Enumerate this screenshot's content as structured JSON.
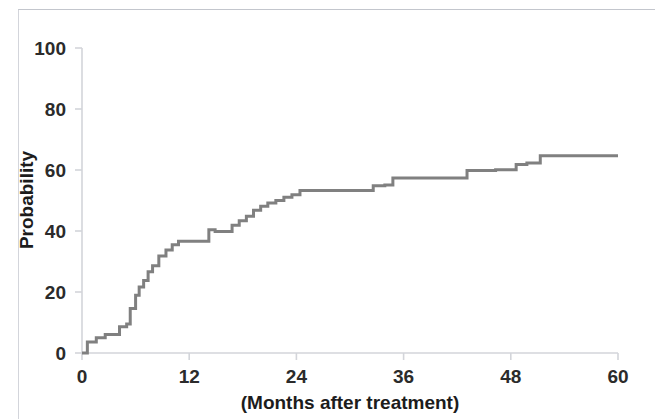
{
  "figure": {
    "background_color": "#ffffff",
    "axis_color": "#d3d5da",
    "tick_label_color": "#2b2b2b",
    "series_color": "#808080"
  },
  "chart_data": {
    "type": "line",
    "subtype": "step",
    "title": "",
    "subtitle": "",
    "xlabel": "(Months after treatment)",
    "ylabel": "Probability",
    "xlim": [
      0,
      60
    ],
    "ylim": [
      0,
      100
    ],
    "xticks": [
      0,
      12,
      24,
      36,
      48,
      60
    ],
    "xtick_labels": [
      "0",
      "12",
      "24",
      "36",
      "48",
      "60"
    ],
    "yticks": [
      0,
      20,
      40,
      60,
      80,
      100
    ],
    "ytick_labels": [
      "0",
      "20",
      "40",
      "60",
      "80",
      "100"
    ],
    "grid": false,
    "legend": null,
    "legend_position": "none",
    "annotations": [],
    "series": [
      {
        "name": "Cumulative probability",
        "color": "#808080",
        "line_width": 3,
        "x": [
          0.0,
          0.6,
          0.6,
          1.6,
          1.6,
          2.6,
          2.6,
          3.3,
          3.3,
          4.2,
          4.2,
          5.0,
          5.0,
          5.4,
          5.4,
          6.0,
          6.0,
          6.4,
          6.4,
          6.9,
          6.9,
          7.4,
          7.4,
          7.9,
          7.9,
          8.6,
          8.6,
          9.4,
          9.4,
          10.1,
          10.1,
          10.8,
          10.8,
          12.0,
          12.0,
          14.2,
          14.2,
          14.9,
          14.9,
          16.8,
          16.8,
          17.6,
          17.6,
          18.4,
          18.4,
          19.2,
          19.2,
          20.0,
          20.0,
          20.8,
          20.8,
          21.7,
          21.7,
          22.6,
          22.6,
          23.5,
          23.5,
          24.4,
          24.4,
          25.3,
          25.3,
          26.4,
          26.4,
          27.5,
          27.5,
          32.6,
          32.6,
          33.9,
          33.9,
          34.8,
          34.8,
          37.2,
          37.2,
          43.1,
          43.1,
          46.3,
          46.3,
          48.6,
          48.6,
          49.8,
          49.8,
          51.3,
          51.3,
          52.4,
          52.4,
          60.0
        ],
        "y": [
          0.0,
          0.0,
          3.6,
          3.6,
          5.0,
          5.0,
          6.1,
          6.1,
          6.1,
          6.1,
          8.6,
          8.6,
          9.5,
          9.5,
          14.6,
          14.6,
          18.9,
          18.9,
          21.6,
          21.6,
          23.8,
          23.8,
          26.6,
          26.6,
          28.6,
          28.6,
          31.8,
          31.8,
          33.8,
          33.8,
          35.5,
          35.5,
          36.6,
          36.6,
          36.6,
          36.6,
          40.4,
          40.4,
          39.8,
          39.8,
          41.9,
          41.9,
          43.4,
          43.4,
          44.8,
          44.8,
          46.8,
          46.8,
          48.1,
          48.1,
          49.2,
          49.2,
          50.0,
          50.0,
          51.1,
          51.1,
          51.9,
          51.9,
          53.3,
          53.3,
          53.3,
          53.3,
          53.3,
          53.3,
          53.3,
          53.3,
          54.8,
          54.8,
          55.1,
          55.1,
          57.4,
          57.4,
          57.4,
          57.4,
          59.8,
          59.8,
          60.1,
          60.1,
          61.8,
          61.8,
          62.3,
          62.3,
          64.7,
          64.7,
          64.7,
          64.7
        ],
        "final_value": 64.7
      }
    ]
  },
  "axes": {
    "y_title": "Probability",
    "x_title": "(Months after treatment)"
  }
}
